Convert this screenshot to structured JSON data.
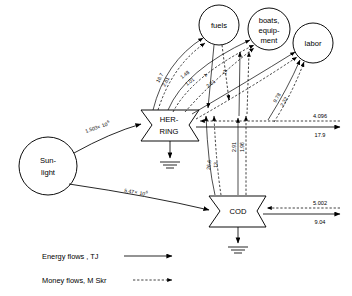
{
  "diagram": {
    "nodes": {
      "sunlight": {
        "line1": "Sun-",
        "line2": "light"
      },
      "herring": {
        "line1": "HER-",
        "line2": "RING"
      },
      "cod": {
        "line1": "COD"
      },
      "fuels": {
        "line1": "fuels"
      },
      "boats": {
        "line1": "boats,",
        "line2": "equip-",
        "line3": "ment"
      },
      "labor": {
        "line1": "labor"
      }
    },
    "inputs": {
      "sun_to_herring": {
        "mantissa": "1.503",
        "times": "×",
        "base": "10",
        "exp": "6"
      },
      "sun_to_cod": {
        "mantissa": "5.47",
        "times": "×",
        "base": "10",
        "exp": "6"
      }
    },
    "flows": {
      "herring_fuels_energy": "16.7",
      "herring_fuels_money": "2.61",
      "herring_boats_energy": "1.48",
      "herring_boats_money": "1.01",
      "fuels_in_energy": "4",
      "fuels_in_money": "11",
      "boats_money_mid": "2.61",
      "labor_energy": "9.78",
      "labor_money": "2.32",
      "cod_fuels_energy": "26.6",
      "cod_fuels_money": "13",
      "cod_boats_energy": "2.91",
      "cod_labor_money": "1.96"
    },
    "outputs": {
      "herring_energy": "4.096",
      "herring_money": "17.9",
      "cod_energy": "5.002",
      "cod_money": "9.04"
    },
    "legend": {
      "energy": "Energy flows , TJ",
      "money": "Money flows, M Skr"
    },
    "colors": {
      "ink": "#000000",
      "paper": "#ffffff"
    }
  }
}
